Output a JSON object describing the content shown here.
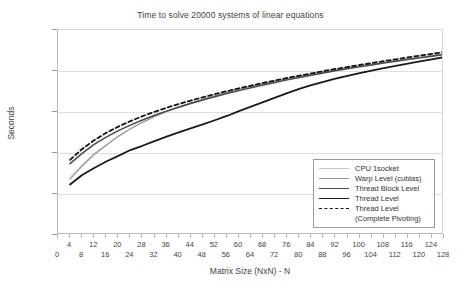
{
  "chart_data": {
    "type": "line",
    "title": "Time to solve 20000 systems of linear equations",
    "xlabel": "Matrix Size (NxN) - N",
    "ylabel": "Seconds",
    "yscale": "log",
    "ylim": [
      0.0001,
      10
    ],
    "xlim": [
      0,
      128
    ],
    "grid": true,
    "legend_position": "inside-bottom-right",
    "ytick_labels": [
      "10",
      "1",
      "0.1",
      "0.01",
      "0",
      "0"
    ],
    "ytick_values": [
      10,
      1,
      0.1,
      0.01,
      0.001,
      0.0001
    ],
    "xtick_labels": [
      "0",
      "4",
      "8",
      "12",
      "16",
      "20",
      "24",
      "28",
      "32",
      "36",
      "40",
      "44",
      "48",
      "52",
      "56",
      "60",
      "64",
      "68",
      "72",
      "76",
      "80",
      "84",
      "88",
      "92",
      "96",
      "100",
      "104",
      "108",
      "112",
      "116",
      "120",
      "124",
      "128"
    ],
    "x": [
      4,
      8,
      12,
      16,
      20,
      24,
      28,
      32,
      36,
      40,
      44,
      48,
      52,
      56,
      60,
      64,
      68,
      72,
      76,
      80,
      84,
      88,
      92,
      96,
      100,
      104,
      108,
      112,
      116,
      120,
      124,
      128
    ],
    "series": [
      {
        "name": "CPU 1socket",
        "color": "#c8c8c8",
        "width": 1,
        "dash": "none",
        "values": [
          0.0026,
          0.0052,
          0.0098,
          0.016,
          0.026,
          0.039,
          0.055,
          0.076,
          0.1,
          0.128,
          0.16,
          0.196,
          0.24,
          0.29,
          0.345,
          0.405,
          0.47,
          0.545,
          0.625,
          0.71,
          0.805,
          0.905,
          1.02,
          1.14,
          1.27,
          1.41,
          1.56,
          1.72,
          1.9,
          2.08,
          2.28,
          2.5
        ]
      },
      {
        "name": "Warp Level (cublas)",
        "color": "#999999",
        "width": 1.3,
        "dash": "none",
        "values": [
          0.0023,
          0.0048,
          0.0092,
          0.0155,
          0.0255,
          0.039,
          0.056,
          0.078,
          0.103,
          0.133,
          0.167,
          0.205,
          0.25,
          0.3,
          0.356,
          0.42,
          0.49,
          0.565,
          0.65,
          0.74,
          0.84,
          0.945,
          1.06,
          1.19,
          1.32,
          1.47,
          1.63,
          1.8,
          1.98,
          2.18,
          2.39,
          2.62
        ]
      },
      {
        "name": "Thread Block Level",
        "color": "#4a4a4a",
        "width": 1.5,
        "dash": "none",
        "values": [
          0.0055,
          0.0098,
          0.0162,
          0.0245,
          0.035,
          0.048,
          0.064,
          0.083,
          0.105,
          0.131,
          0.161,
          0.196,
          0.236,
          0.281,
          0.332,
          0.39,
          0.455,
          0.527,
          0.607,
          0.694,
          0.79,
          0.893,
          1.01,
          1.13,
          1.26,
          1.4,
          1.56,
          1.72,
          1.9,
          2.09,
          2.3,
          2.52
        ]
      },
      {
        "name": "Thread Level",
        "color": "#1a1a1a",
        "width": 1.8,
        "dash": "none",
        "values": [
          0.0017,
          0.0029,
          0.0043,
          0.0062,
          0.0085,
          0.0118,
          0.015,
          0.0195,
          0.025,
          0.032,
          0.04,
          0.05,
          0.063,
          0.08,
          0.105,
          0.135,
          0.175,
          0.225,
          0.29,
          0.365,
          0.45,
          0.545,
          0.65,
          0.765,
          0.89,
          1.02,
          1.17,
          1.33,
          1.51,
          1.71,
          1.93,
          2.18
        ]
      },
      {
        "name": "Thread Level (Complete Pivoting)",
        "color": "#141414",
        "width": 1.8,
        "dash": "4 3",
        "values": [
          0.0068,
          0.0125,
          0.0205,
          0.031,
          0.044,
          0.06,
          0.079,
          0.101,
          0.127,
          0.156,
          0.19,
          0.228,
          0.272,
          0.322,
          0.378,
          0.44,
          0.51,
          0.588,
          0.675,
          0.77,
          0.875,
          0.99,
          1.12,
          1.25,
          1.4,
          1.56,
          1.74,
          1.93,
          2.14,
          2.37,
          2.62,
          2.9
        ]
      }
    ]
  },
  "legend": {
    "items": [
      {
        "label": "CPU 1socket",
        "sub": ""
      },
      {
        "label": "Warp Level (cublas)",
        "sub": ""
      },
      {
        "label": "Thread Block Level",
        "sub": ""
      },
      {
        "label": "Thread Level",
        "sub": ""
      },
      {
        "label": "Thread Level",
        "sub": "(Complete Pivoting)"
      }
    ]
  }
}
